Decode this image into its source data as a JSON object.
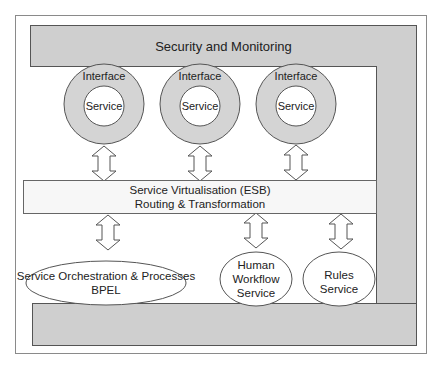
{
  "diagram": {
    "top_bar": {
      "label": "Security and Monitoring"
    },
    "interfaces": [
      {
        "outer_label": "Interface",
        "inner_label": "Service"
      },
      {
        "outer_label": "Interface",
        "inner_label": "Service"
      },
      {
        "outer_label": "Interface",
        "inner_label": "Service"
      }
    ],
    "esb": {
      "line1": "Service Virtualisation (ESB)",
      "line2": "Routing & Transformation"
    },
    "bottom_services": [
      {
        "lines": [
          "Service Orchestration & Processes",
          "BPEL"
        ]
      },
      {
        "lines": [
          "Human",
          "Workflow",
          "Service"
        ]
      },
      {
        "lines": [
          "Rules",
          "Service"
        ]
      }
    ],
    "colors": {
      "bar_fill": "#cfcfcf",
      "ring_fill": "#d4d4d4",
      "esb_fill": "#f7f7f7",
      "stroke": "#555555"
    }
  }
}
